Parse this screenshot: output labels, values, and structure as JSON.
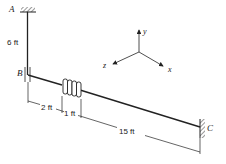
{
  "diagram": {
    "points": {
      "A": "A",
      "B": "B",
      "C": "C"
    },
    "dimensions": {
      "vertical_AB": "6 ft",
      "segment_1": "2 ft",
      "segment_2": "1 ft",
      "segment_3": "15 ft"
    },
    "axes": {
      "x": "x",
      "y": "y",
      "z": "z"
    },
    "colors": {
      "line": "#222222",
      "background": "#ffffff"
    }
  }
}
